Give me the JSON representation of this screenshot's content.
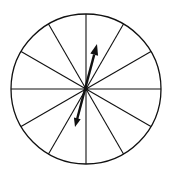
{
  "spinner": {
    "sectors": 12,
    "center": [
      86,
      89
    ],
    "radius": 75,
    "stroke_color": "#111111",
    "fill_color": "#ffffff",
    "arrow": {
      "tip": [
        97,
        44
      ],
      "tail": [
        75,
        127
      ],
      "color": "#111111"
    }
  }
}
